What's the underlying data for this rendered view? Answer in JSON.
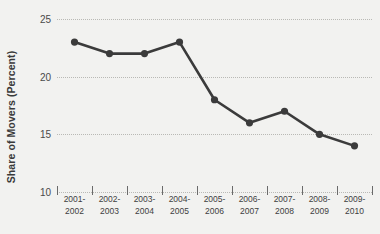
{
  "chart_data": {
    "type": "line",
    "title": "",
    "xlabel": "",
    "ylabel": "Share of Movers (Percent)",
    "categories": [
      "2001-\n2002",
      "2002-\n2003",
      "2003-\n2004",
      "2004-\n2005",
      "2005-\n2006",
      "2006-\n2007",
      "2007-\n2008",
      "2008-\n2009",
      "2009-\n2010"
    ],
    "category_lines": [
      [
        "2001-",
        "2002"
      ],
      [
        "2002-",
        "2003"
      ],
      [
        "2003-",
        "2004"
      ],
      [
        "2004-",
        "2005"
      ],
      [
        "2005-",
        "2006"
      ],
      [
        "2006-",
        "2007"
      ],
      [
        "2007-",
        "2008"
      ],
      [
        "2008-",
        "2009"
      ],
      [
        "2009-",
        "2010"
      ]
    ],
    "values": [
      23,
      22,
      22,
      23,
      18,
      16,
      17,
      15,
      14
    ],
    "ylim": [
      10,
      25
    ],
    "yticks": [
      10,
      15,
      20,
      25
    ],
    "ytick_labels": [
      "10",
      "15",
      "20",
      "25"
    ],
    "grid": true,
    "grid_style": "dotted",
    "legend": "none",
    "series_color": "#3b3b3b",
    "marker": "circle",
    "background_color": "#f2f2f0",
    "gridline_color": "#b9b9b5",
    "axis_text_color": "#3f3f3f"
  }
}
